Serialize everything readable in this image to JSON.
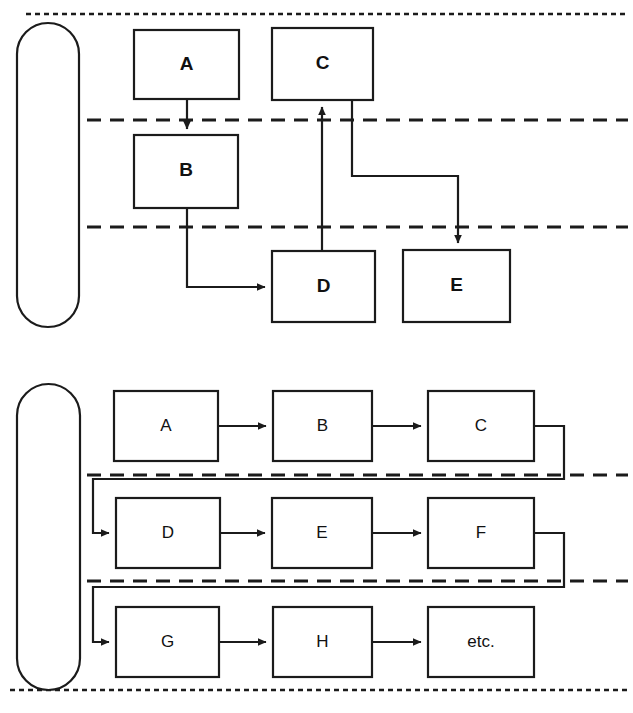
{
  "figure": {
    "title": "",
    "background_color": "#ffffff",
    "line_color": "#1b1b1b",
    "width": 633,
    "height": 713
  },
  "diagrams": [
    {
      "id": "top-diagram",
      "name": "branching-flow-diagram",
      "container": {
        "name": "lane-capsule",
        "shape": "rounded-capsule",
        "x": 16,
        "y": 22,
        "w": 63,
        "h": 306
      },
      "swimlane_dividers": [
        {
          "name": "swimlane-divider-1",
          "y": 120
        },
        {
          "name": "swimlane-divider-2",
          "y": 227
        }
      ],
      "nodes": [
        {
          "id": "t-A",
          "label": "A",
          "x": 134,
          "y": 30,
          "w": 105,
          "h": 69
        },
        {
          "id": "t-C",
          "label": "C",
          "x": 272,
          "y": 28,
          "w": 101,
          "h": 72
        },
        {
          "id": "t-B",
          "label": "B",
          "x": 134,
          "y": 135,
          "w": 104,
          "h": 73
        },
        {
          "id": "t-D",
          "label": "D",
          "x": 272,
          "y": 251,
          "w": 103,
          "h": 71
        },
        {
          "id": "t-E",
          "label": "E",
          "x": 403,
          "y": 250,
          "w": 107,
          "h": 72
        }
      ],
      "edges": [
        {
          "id": "t-e1",
          "from": "t-A",
          "to": "t-B",
          "arrow": true,
          "label": ""
        },
        {
          "id": "t-e2",
          "from": "t-B",
          "to": "t-D",
          "arrow": true,
          "label": ""
        },
        {
          "id": "t-e3",
          "from": "t-D",
          "to": "t-C",
          "arrow": true,
          "label": ""
        },
        {
          "id": "t-e4",
          "from": "t-C",
          "to": "t-E",
          "arrow": true,
          "label": ""
        }
      ]
    },
    {
      "id": "bottom-diagram",
      "name": "serpentine-flow-diagram",
      "container": {
        "name": "lane-capsule",
        "shape": "rounded-capsule",
        "x": 16,
        "y": 383,
        "w": 64,
        "h": 308
      },
      "swimlane_dividers": [
        {
          "name": "swimlane-divider-1",
          "y": 475
        },
        {
          "name": "swimlane-divider-2",
          "y": 581
        }
      ],
      "nodes": [
        {
          "id": "b-A",
          "label": "A",
          "x": 114,
          "y": 391,
          "w": 104,
          "h": 70
        },
        {
          "id": "b-B",
          "label": "B",
          "x": 273,
          "y": 391,
          "w": 99,
          "h": 70
        },
        {
          "id": "b-C",
          "label": "C",
          "x": 428,
          "y": 391,
          "w": 106,
          "h": 70
        },
        {
          "id": "b-D",
          "label": "D",
          "x": 116,
          "y": 498,
          "w": 104,
          "h": 70
        },
        {
          "id": "b-E",
          "label": "E",
          "x": 272,
          "y": 498,
          "w": 100,
          "h": 70
        },
        {
          "id": "b-F",
          "label": "F",
          "x": 428,
          "y": 498,
          "w": 106,
          "h": 70
        },
        {
          "id": "b-G",
          "label": "G",
          "x": 116,
          "y": 607,
          "w": 103,
          "h": 70
        },
        {
          "id": "b-H",
          "label": "H",
          "x": 273,
          "y": 607,
          "w": 99,
          "h": 70
        },
        {
          "id": "b-etc",
          "label": "etc.",
          "x": 428,
          "y": 607,
          "w": 106,
          "h": 70
        }
      ],
      "edges": [
        {
          "id": "b-e1",
          "from": "b-A",
          "to": "b-B",
          "arrow": true,
          "label": ""
        },
        {
          "id": "b-e2",
          "from": "b-B",
          "to": "b-C",
          "arrow": true,
          "label": ""
        },
        {
          "id": "b-e3",
          "from": "b-C",
          "to": "b-D",
          "arrow": true,
          "label": ""
        },
        {
          "id": "b-e4",
          "from": "b-D",
          "to": "b-E",
          "arrow": true,
          "label": ""
        },
        {
          "id": "b-e5",
          "from": "b-E",
          "to": "b-F",
          "arrow": true,
          "label": ""
        },
        {
          "id": "b-e6",
          "from": "b-F",
          "to": "b-G",
          "arrow": true,
          "label": ""
        },
        {
          "id": "b-e7",
          "from": "b-G",
          "to": "b-H",
          "arrow": true,
          "label": ""
        },
        {
          "id": "b-e8",
          "from": "b-H",
          "to": "b-etc",
          "arrow": true,
          "label": ""
        }
      ]
    }
  ],
  "page_borders": [
    {
      "name": "page-border-top",
      "y": 14
    },
    {
      "name": "page-border-bottom",
      "y": 690
    }
  ],
  "labels": {
    "top": {
      "A": "A",
      "B": "B",
      "C": "C",
      "D": "D",
      "E": "E"
    },
    "bottom": {
      "A": "A",
      "B": "B",
      "C": "C",
      "D": "D",
      "E": "E",
      "F": "F",
      "G": "G",
      "H": "H",
      "etc": "etc."
    }
  }
}
